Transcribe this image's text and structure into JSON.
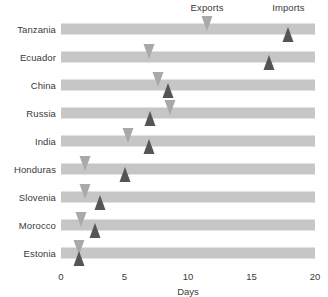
{
  "legend": {
    "exports_label": "Exports",
    "imports_label": "Imports"
  },
  "axis": {
    "title": "Days",
    "ticks": [
      "0",
      "5",
      "10",
      "15",
      "20"
    ]
  },
  "colors": {
    "bar": "#c6c6c6",
    "exports_marker": "#a9a9a9",
    "imports_marker": "#555555",
    "text": "#3a3a3a",
    "background": "#ffffff"
  },
  "rows": [
    {
      "country": "Tanzania",
      "exports": 11.5,
      "imports": 17.9
    },
    {
      "country": "Ecuador",
      "exports": 6.9,
      "imports": 16.4
    },
    {
      "country": "China",
      "exports": 7.6,
      "imports": 8.4
    },
    {
      "country": "Russia",
      "exports": 8.6,
      "imports": 7.0
    },
    {
      "country": "India",
      "exports": 5.3,
      "imports": 6.9
    },
    {
      "country": "Honduras",
      "exports": 1.9,
      "imports": 5.0
    },
    {
      "country": "Slovenia",
      "exports": 1.9,
      "imports": 3.1
    },
    {
      "country": "Morocco",
      "exports": 1.6,
      "imports": 2.7
    },
    {
      "country": "Estonia",
      "exports": 1.4,
      "imports": 1.4
    }
  ],
  "chart_data": {
    "type": "bar",
    "title": "",
    "subtitle": "",
    "xlabel": "Days",
    "ylabel": "",
    "xlim": [
      0,
      20
    ],
    "xticks": [
      0,
      5,
      10,
      15,
      20
    ],
    "grid": false,
    "legend_position": "top",
    "orientation": "horizontal",
    "categories": [
      "Tanzania",
      "Ecuador",
      "China",
      "Russia",
      "India",
      "Honduras",
      "Slovenia",
      "Morocco",
      "Estonia"
    ],
    "series": [
      {
        "name": "Exports",
        "marker": "down-triangle",
        "color": "#a9a9a9",
        "values": [
          11.5,
          6.9,
          7.6,
          8.6,
          5.3,
          1.9,
          1.9,
          1.6,
          1.4
        ]
      },
      {
        "name": "Imports",
        "marker": "up-triangle",
        "color": "#555555",
        "values": [
          17.9,
          16.4,
          8.4,
          7.0,
          6.9,
          5.0,
          3.1,
          2.7,
          1.4
        ]
      }
    ],
    "annotations": [
      {
        "text": "Exports",
        "x": 11.5,
        "position": "top"
      },
      {
        "text": "Imports",
        "x": 17.9,
        "position": "top"
      }
    ]
  }
}
